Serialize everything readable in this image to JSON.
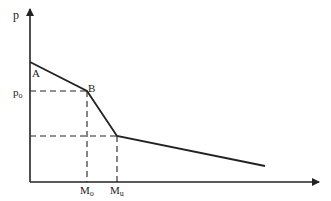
{
  "diagram": {
    "y_axis_label": "p",
    "points": {
      "A": "A",
      "B": "B"
    },
    "y_ticks": {
      "p0": "p",
      "p0_sub": "o"
    },
    "x_ticks": {
      "M0": "M",
      "M0_sub": "o",
      "Mu": "M",
      "Mu_sub": "u"
    },
    "colors": {
      "line": "#222222"
    }
  }
}
